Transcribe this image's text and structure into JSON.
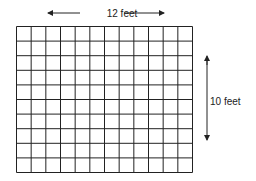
{
  "diagram": {
    "width_label": "12 feet",
    "height_label": "10 feet",
    "columns": 12,
    "rows": 10,
    "line_color": "#222222"
  }
}
